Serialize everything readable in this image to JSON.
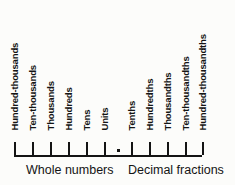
{
  "diagram": {
    "axis": {
      "start_x": 14,
      "end_x": 202,
      "y": 155,
      "tick_spacing": 18
    },
    "decimal_point": {
      "symbol": ".",
      "x": 117
    },
    "place_values": [
      {
        "label": "Hundred-thousands",
        "x": 14,
        "group": "whole"
      },
      {
        "label": "Ten-thousands",
        "x": 32,
        "group": "whole"
      },
      {
        "label": "Thousands",
        "x": 50,
        "group": "whole"
      },
      {
        "label": "Hundreds",
        "x": 68,
        "group": "whole"
      },
      {
        "label": "Tens",
        "x": 86,
        "group": "whole"
      },
      {
        "label": "Units",
        "x": 104,
        "group": "whole"
      },
      {
        "label": "Tenths",
        "x": 131,
        "group": "decimal"
      },
      {
        "label": "Hundredths",
        "x": 149,
        "group": "decimal"
      },
      {
        "label": "Thousandths",
        "x": 167,
        "group": "decimal"
      },
      {
        "label": "Ten-thousandths",
        "x": 185,
        "group": "decimal"
      },
      {
        "label": "Hundred-thousandths",
        "x": 202,
        "group": "decimal"
      }
    ],
    "groups": [
      {
        "caption": "Whole numbers",
        "x": 26
      },
      {
        "caption": "Decimal fractions",
        "x": 128
      }
    ],
    "colors": {
      "ink": "#141414",
      "background": "#fcfcfa"
    }
  }
}
